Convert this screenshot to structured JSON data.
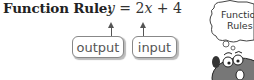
{
  "rule": {
    "label": "Function Rule:",
    "equation_parts": [
      "y",
      " = 2",
      "x",
      " + 4"
    ]
  },
  "annotations": {
    "output_label": "output",
    "input_label": "input"
  },
  "cartoon": {
    "bubble_line1": "Functio",
    "bubble_line2": "Rules"
  }
}
